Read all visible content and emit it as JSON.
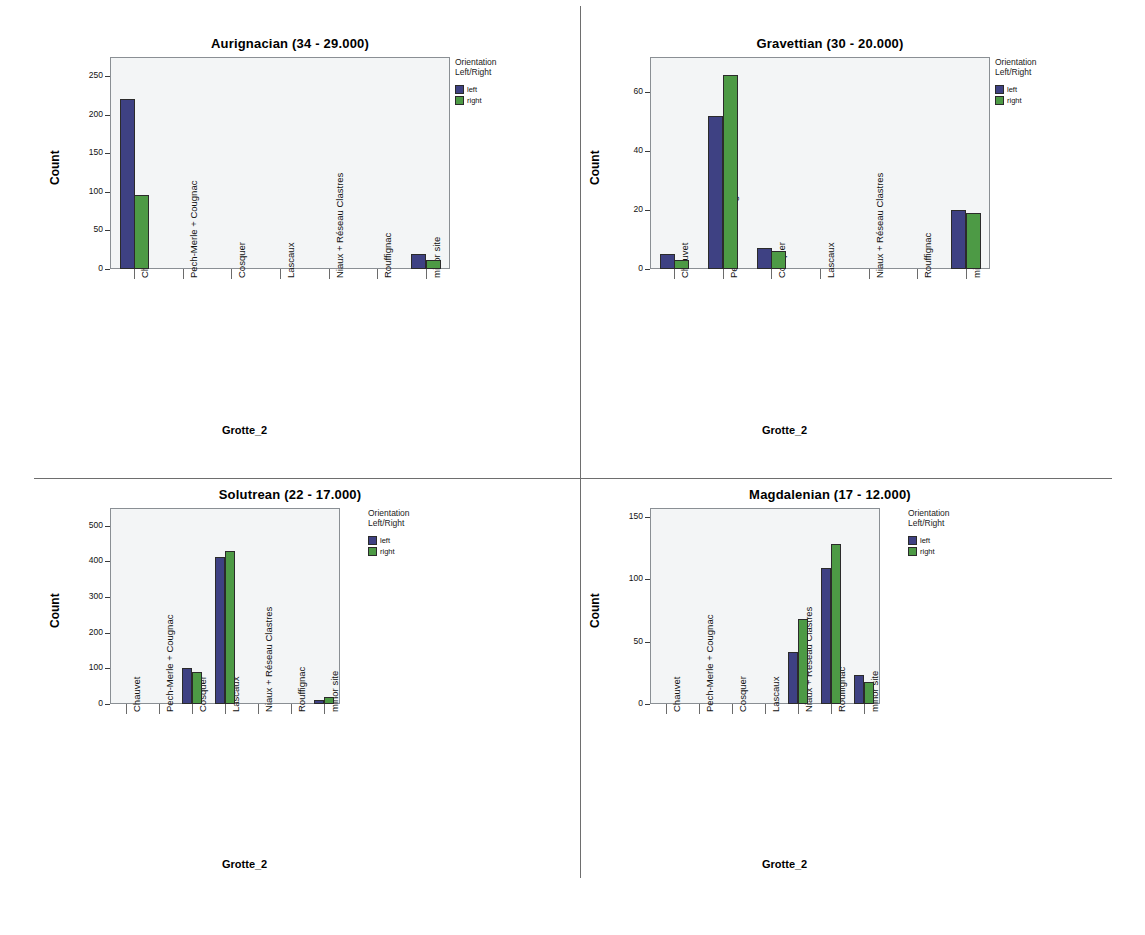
{
  "figure": {
    "legend_title_line1": "Orientation",
    "legend_title_line2": "Left/Right",
    "series_labels": {
      "left": "left",
      "right": "right"
    },
    "colors": {
      "left": "#3e4183",
      "right": "#4d9a45",
      "plot_bg": "#f3f5f6",
      "plot_border": "#8a8f94",
      "divider": "#6e6e6e"
    }
  },
  "chart_data": [
    {
      "id": "aurignacian",
      "type": "bar",
      "title": "Aurignacian (34 - 29.000)",
      "xlabel": "Grotte_2",
      "ylabel": "Count",
      "grid": false,
      "legend_position": "right",
      "ylim": [
        0,
        275
      ],
      "yticks": [
        0,
        50,
        100,
        150,
        200,
        250
      ],
      "categories": [
        "Chauvet",
        "Pech-Merle + Cougnac",
        "Cosquer",
        "Lascaux",
        "Niaux + Réseau Clastres",
        "Rouffignac",
        "minor site"
      ],
      "series": [
        {
          "name": "left",
          "values": [
            221,
            0,
            0,
            0,
            0,
            0,
            19
          ]
        },
        {
          "name": "right",
          "values": [
            96,
            0,
            0,
            0,
            0,
            0,
            12
          ]
        }
      ]
    },
    {
      "id": "gravettian",
      "type": "bar",
      "title": "Gravettian (30 - 20.000)",
      "xlabel": "Grotte_2",
      "ylabel": "Count",
      "grid": false,
      "legend_position": "right",
      "ylim": [
        0,
        72
      ],
      "yticks": [
        0,
        20,
        40,
        60
      ],
      "categories": [
        "Chauvet",
        "Pech-Merle + Cougnac",
        "Cosquer",
        "Lascaux",
        "Niaux + Réseau Clastres",
        "Rouffignac",
        "minor site"
      ],
      "series": [
        {
          "name": "left",
          "values": [
            5,
            52,
            7,
            0,
            0,
            0,
            20
          ]
        },
        {
          "name": "right",
          "values": [
            3,
            66,
            6,
            0,
            0,
            0,
            19
          ]
        }
      ]
    },
    {
      "id": "solutrean",
      "type": "bar",
      "title": "Solutrean (22 - 17.000)",
      "xlabel": "Grotte_2",
      "ylabel": "Count",
      "grid": false,
      "legend_position": "right",
      "ylim": [
        0,
        550
      ],
      "yticks": [
        0,
        100,
        200,
        300,
        400,
        500
      ],
      "categories": [
        "Chauvet",
        "Pech-Merle + Cougnac",
        "Cosquer",
        "Lascaux",
        "Niaux + Réseau Clastres",
        "Rouffignac",
        "minor site"
      ],
      "series": [
        {
          "name": "left",
          "values": [
            0,
            0,
            101,
            412,
            0,
            0,
            10
          ]
        },
        {
          "name": "right",
          "values": [
            0,
            0,
            89,
            428,
            0,
            0,
            20
          ]
        }
      ]
    },
    {
      "id": "magdalenian",
      "type": "bar",
      "title": "Magdalenian (17 - 12.000)",
      "xlabel": "Grotte_2",
      "ylabel": "Count",
      "grid": false,
      "legend_position": "right",
      "ylim": [
        0,
        157
      ],
      "yticks": [
        0,
        50,
        100,
        150
      ],
      "categories": [
        "Chauvet",
        "Pech-Merle + Cougnac",
        "Cosquer",
        "Lascaux",
        "Niaux + Réseau Clastres",
        "Rouffignac",
        "minor site"
      ],
      "series": [
        {
          "name": "left",
          "values": [
            0,
            0,
            0,
            0,
            42,
            109,
            23
          ]
        },
        {
          "name": "right",
          "values": [
            0,
            0,
            0,
            0,
            68,
            128,
            18
          ]
        }
      ]
    }
  ]
}
